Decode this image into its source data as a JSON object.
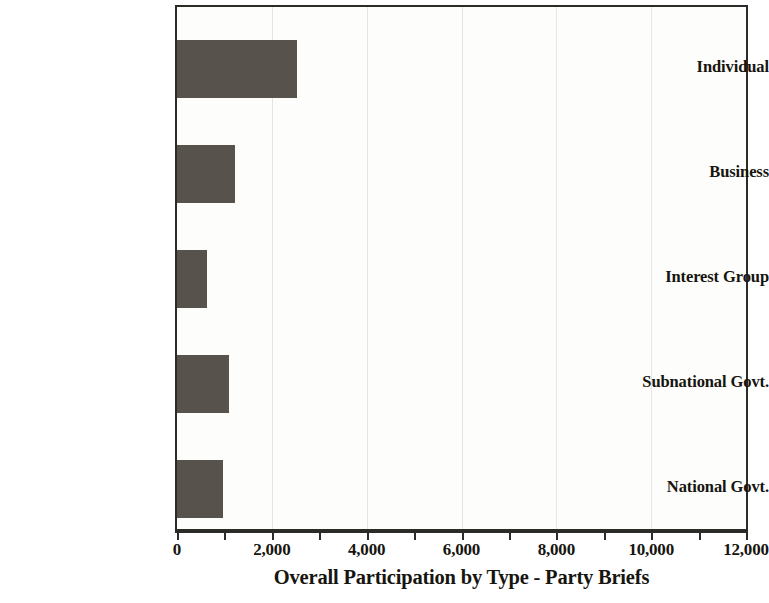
{
  "chart_data": {
    "type": "bar",
    "orientation": "horizontal",
    "title": "",
    "xlabel": "Overall Participation by Type - Party Briefs",
    "ylabel": "",
    "categories": [
      "Individual",
      "Business",
      "Interest Group",
      "Subnational Govt.",
      "National Govt."
    ],
    "values": [
      2540,
      1230,
      640,
      1100,
      970
    ],
    "series": [
      {
        "name": "Overall Participation by Type - Party Briefs",
        "values": [
          2540,
          1230,
          640,
          1100,
          970
        ]
      }
    ],
    "xlim": [
      0,
      12000
    ],
    "xticks": [
      0,
      2000,
      4000,
      6000,
      8000,
      10000,
      12000
    ],
    "xtick_labels": [
      "0",
      "2,000",
      "4,000",
      "6,000",
      "8,000",
      "10,000",
      "12,000"
    ],
    "x_minor_tick_interval": 1000,
    "grid": "vertical-major",
    "legend": "none",
    "bar_color": "#57524C",
    "plot_background": "#FDFDFB",
    "axis_color": "#2B2B28",
    "gridline_color": "#E6E6E0"
  }
}
